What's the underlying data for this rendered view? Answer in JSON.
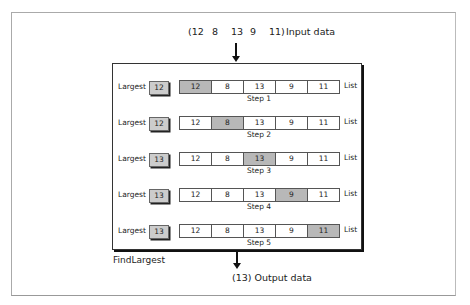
{
  "input": {
    "values": [
      "(12",
      "8",
      "13",
      "9",
      "11)"
    ],
    "label": "Input data"
  },
  "process_name": "FindLargest",
  "output": {
    "label": "(13) Output data"
  },
  "row_label": "Largest",
  "list_label": "List",
  "steps": [
    {
      "step": "Step 1",
      "largest": "12",
      "list": [
        "12",
        "8",
        "13",
        "9",
        "11"
      ],
      "highlight": 0
    },
    {
      "step": "Step 2",
      "largest": "12",
      "list": [
        "12",
        "8",
        "13",
        "9",
        "11"
      ],
      "highlight": 1
    },
    {
      "step": "Step 3",
      "largest": "13",
      "list": [
        "12",
        "8",
        "13",
        "9",
        "11"
      ],
      "highlight": 2
    },
    {
      "step": "Step 4",
      "largest": "13",
      "list": [
        "12",
        "8",
        "13",
        "9",
        "11"
      ],
      "highlight": 3
    },
    {
      "step": "Step 5",
      "largest": "13",
      "list": [
        "12",
        "8",
        "13",
        "9",
        "11"
      ],
      "highlight": 4
    }
  ]
}
